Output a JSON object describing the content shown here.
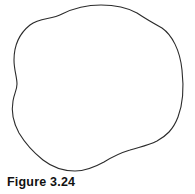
{
  "figure": {
    "caption": "Figure 3.24",
    "background_color": "#ffffff",
    "stroke_color": "#2b2b2b",
    "stroke_width": 1.1,
    "fill": "none",
    "shape_name": "closed-irregular-blob",
    "bounding_box": {
      "x_min": 11,
      "y_min": 5,
      "x_max": 183,
      "y_max": 171
    },
    "path": "M 62 14 C 74 8 88 5 101 5 C 116 5 128 8 137 13 C 146 19 153 23 162 28 C 172 35 180 50 182 70 C 184 88 183 104 178 117 C 173 130 166 136 157 141 C 147 146 139 147 130 150 C 120 153 112 157 104 162 C 95 167 86 171 75 171 C 63 171 52 167 43 160 C 33 152 25 143 19 133 C 13 122 11 112 13 101 C 14 94 17 90 17 84 C 17 77 14 70 14 60 C 14 45 20 33 30 25 C 40 17 51 20 62 14 Z"
  }
}
